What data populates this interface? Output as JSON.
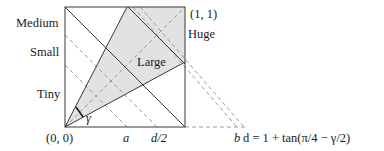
{
  "diagram": {
    "colors": {
      "stroke": "#3a3a3a",
      "dashed": "#9a9a9a",
      "shade": "#e2e2e2",
      "text": "#1a1a1a"
    },
    "corner_top_right": "(1, 1)",
    "corner_origin": "(0, 0)",
    "left_labels": {
      "medium": "Medium",
      "small": "Small",
      "tiny": "Tiny"
    },
    "region_labels": {
      "huge": "Huge",
      "large": "Large"
    },
    "angle_label": "γ",
    "bottom_ticks": {
      "a": "a",
      "d_half": "d/2",
      "b": "b"
    },
    "formula": "d = 1 + tan(π/4 − γ/2)"
  }
}
